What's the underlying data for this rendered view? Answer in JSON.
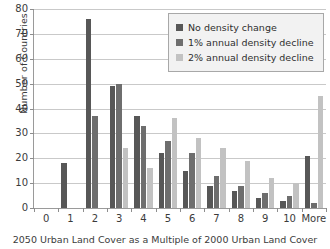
{
  "chart_data": {
    "type": "bar",
    "title": "",
    "xlabel": "2050 Urban Land Cover as a Multiple of 2000 Urban Land Cover",
    "ylabel": "Number of Countries",
    "ylim": [
      0,
      80
    ],
    "ytick_step": 10,
    "yticks": [
      0,
      10,
      20,
      30,
      40,
      50,
      60,
      70,
      80
    ],
    "grid": true,
    "legend_position": "top-right",
    "categories": [
      "0",
      "1",
      "2",
      "3",
      "4",
      "5",
      "6",
      "7",
      "8",
      "9",
      "10",
      "More"
    ],
    "series": [
      {
        "name": "No density change",
        "color": "#575757",
        "values": [
          0,
          18,
          76,
          49,
          37,
          22,
          15,
          9,
          7,
          4,
          3,
          21
        ]
      },
      {
        "name": "1% annual density decline",
        "color": "#6e6e6e",
        "values": [
          0,
          0,
          37,
          50,
          33,
          27,
          22,
          13,
          9,
          6,
          5,
          2
        ]
      },
      {
        "name": "2% annual density decline",
        "color": "#c2c2c2",
        "values": [
          0,
          0,
          0,
          24,
          16,
          36,
          28,
          24,
          19,
          12,
          10,
          45
        ]
      }
    ]
  },
  "legend": {
    "entries": [
      {
        "label": "No density change",
        "color": "#575757"
      },
      {
        "label": "1% annual density decline",
        "color": "#6e6e6e"
      },
      {
        "label": "2% annual density decline",
        "color": "#c2c2c2"
      }
    ]
  }
}
